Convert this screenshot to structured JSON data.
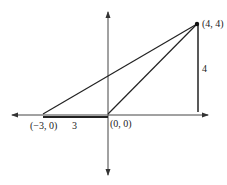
{
  "diagram": {
    "type": "coordinate-geometry",
    "points": {
      "a": {
        "label": "(−3, 0)",
        "x": -3,
        "y": 0
      },
      "o": {
        "label": "(0, 0)",
        "x": 0,
        "y": 0
      },
      "p": {
        "label": "(4, 4)",
        "x": 4,
        "y": 4
      }
    },
    "measurements": {
      "base_length": "3",
      "height": "4"
    },
    "colors": {
      "line": "#222222",
      "axis": "#444444",
      "background": "#ffffff"
    }
  }
}
